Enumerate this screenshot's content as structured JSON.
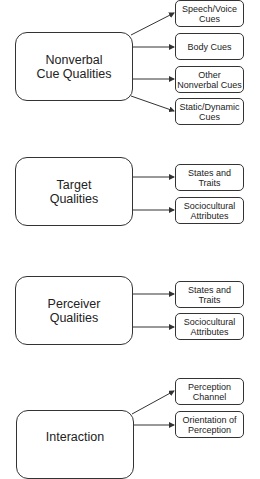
{
  "diagram": {
    "groups": [
      {
        "title": "Nonverbal\nCue Qualities",
        "children": [
          "Speech/Voice\nCues",
          "Body Cues",
          "Other\nNonverbal Cues",
          "Static/Dynamic\nCues"
        ]
      },
      {
        "title": "Target\nQualities",
        "children": [
          "States and\nTraits",
          "Sociocultural\nAttributes"
        ]
      },
      {
        "title": "Perceiver\nQualities",
        "children": [
          "States and\nTraits",
          "Sociocultural\nAttributes"
        ]
      },
      {
        "title": "Interaction",
        "children": [
          "Perception\nChannel",
          "Orientation of\nPerception"
        ]
      }
    ],
    "colors": {
      "stroke": "#333333",
      "fill": "#ffffff",
      "text": "#222222"
    }
  }
}
